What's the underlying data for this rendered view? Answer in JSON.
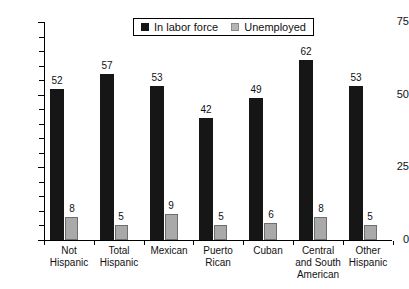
{
  "chart_data": {
    "type": "bar",
    "title": "",
    "subtitle": "",
    "xlabel": "",
    "ylabel": "",
    "ylim": [
      0,
      75
    ],
    "yticks": [
      0,
      25,
      50,
      75
    ],
    "ytick_labels": [
      "0",
      "25",
      "50",
      "75"
    ],
    "minor_tick_step": 5,
    "grid": false,
    "legend_position": "top-center",
    "categories": [
      "Not Hispanic",
      "Total Hispanic",
      "Mexican",
      "Puerto Rican",
      "Cuban",
      "Central and South American",
      "Other Hispanic"
    ],
    "category_lines": [
      [
        "Not",
        "Hispanic"
      ],
      [
        "Total",
        "Hispanic"
      ],
      [
        "Mexican"
      ],
      [
        "Puerto",
        "Rican"
      ],
      [
        "Cuban"
      ],
      [
        "Central",
        "and South",
        "American"
      ],
      [
        "Other",
        "Hispanic"
      ]
    ],
    "series": [
      {
        "name": "In labor force",
        "color": "#161616",
        "values": [
          52,
          57,
          53,
          42,
          49,
          62,
          53
        ],
        "value_labels": [
          "52",
          "57",
          "53",
          "42",
          "49",
          "62",
          "53"
        ]
      },
      {
        "name": "Unemployed",
        "color": "#a9a9a9",
        "values": [
          8,
          5,
          9,
          5,
          6,
          8,
          5
        ],
        "value_labels": [
          "8",
          "5",
          "9",
          "5",
          "6",
          "8",
          "5"
        ]
      }
    ]
  },
  "legend": {
    "items": [
      {
        "label": "In labor force",
        "swatch": "legend-swatch-dark",
        "color": "#161616"
      },
      {
        "label": "Unemployed",
        "swatch": "legend-swatch-gray",
        "color": "#b5b5b5"
      }
    ]
  },
  "axes": {
    "y": {
      "labels": [
        "75",
        "50",
        "25",
        "0"
      ]
    }
  }
}
